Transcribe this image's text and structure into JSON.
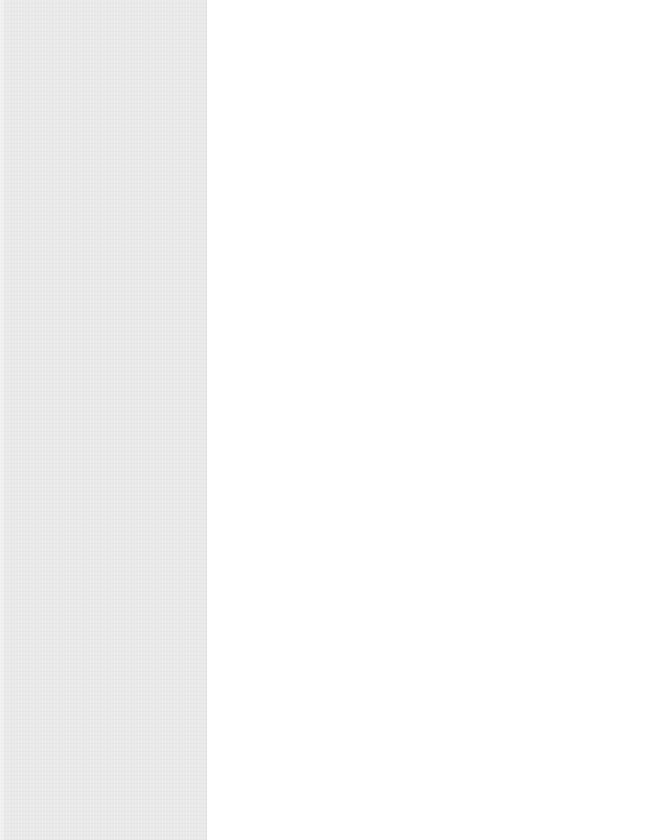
{
  "layout": {
    "left_panel": {
      "width_px": 207,
      "background_color": "#e9e9e9",
      "content": []
    },
    "main_area": {
      "background_color": "#ffffff",
      "content": []
    }
  }
}
